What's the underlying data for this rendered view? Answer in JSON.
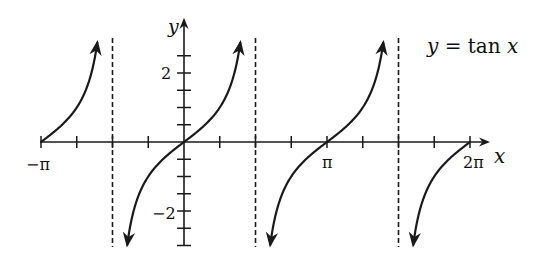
{
  "chart_data": {
    "type": "line",
    "title": "y = tan x",
    "function": "tan",
    "xlabel": "x",
    "ylabel": "y",
    "xlim": [
      -3.14159,
      6.28318
    ],
    "ylim": [
      -3,
      3
    ],
    "x_tick_labels": [
      "−π",
      "π",
      "2π"
    ],
    "x_tick_values": [
      -3.14159,
      3.14159,
      6.28318
    ],
    "x_tick_step": 0.785398,
    "y_tick_labels": [
      "2",
      "−2"
    ],
    "y_tick_values": [
      2,
      -2
    ],
    "y_tick_step": 0.5,
    "asymptotes": [
      -1.5708,
      1.5708,
      4.7124
    ],
    "asymptote_style": "dashed",
    "branches": [
      {
        "x_start": -3.14159,
        "x_end": -1.85,
        "y_start": 0,
        "y_end": 3.4
      },
      {
        "x_start": -1.29,
        "x_start_y": -3.4,
        "x_end": 1.29,
        "y_end": 3.4
      },
      {
        "x_start": 1.85,
        "y_start": -3.4,
        "x_end": 4.43,
        "y_end": 3.4
      },
      {
        "x_start": 4.99,
        "y_start": -3.4,
        "x_end": 6.28318,
        "y_end": 0
      }
    ],
    "grid": false,
    "legend": null
  },
  "labels": {
    "equation": "y = tan x",
    "x_axis": "x",
    "y_axis": "y",
    "neg_pi": "−π",
    "pi": "π",
    "two_pi": "2π",
    "y_two": "2",
    "y_neg_two": "−2"
  }
}
